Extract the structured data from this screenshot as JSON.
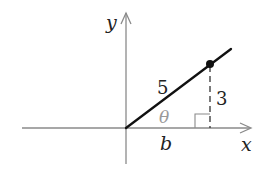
{
  "diagram": {
    "axes": {
      "x_label": "x",
      "y_label": "y"
    },
    "hypotenuse_label": "5",
    "opposite_label": "3",
    "adjacent_label": "b",
    "angle_label": "θ",
    "colors": {
      "axis": "#8a8a8a",
      "ray": "#111111",
      "point": "#111111",
      "angle_label": "#9a9a9a",
      "text": "#222222",
      "dashed": "#333333"
    }
  }
}
